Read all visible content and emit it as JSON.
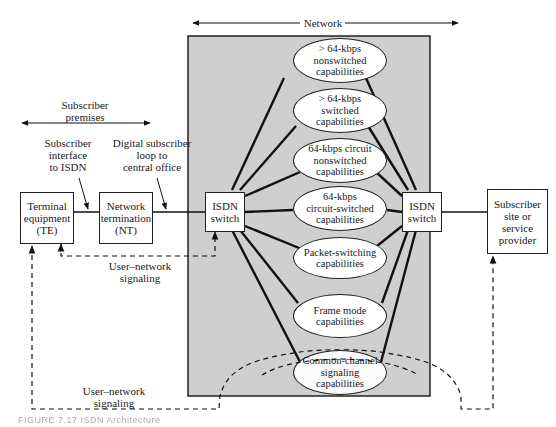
{
  "diagram": {
    "network_label": "Network",
    "subscriber_premises_label": "Subscriber\npremises",
    "annotations": {
      "subscriber_interface": "Subscriber\ninterface\nto ISDN",
      "digital_loop": "Digital subscriber\nloop to\ncentral office",
      "user_network_signaling_upper": "User–network\nsignaling",
      "user_network_signaling_lower": "User–network\nsignaling"
    },
    "nodes": {
      "te": "Terminal\nequipment\n(TE)",
      "nt": "Network\ntermination\n(NT)",
      "isdn_left": "ISDN\nswitch",
      "isdn_right": "ISDN\nswitch",
      "subscriber_site": "Subscriber\nsite or\nservice\nprovider"
    },
    "capabilities": [
      "> 64-kbps\nnonswitched\ncapabilities",
      "> 64-kbps\nswitched\ncapabilities",
      "64-kbps circuit\nnonswitched\ncapabilities",
      "64-kbps\ncircuit-switched\ncapabilities",
      "Packet-switching\ncapabilities",
      "Frame mode\ncapabilities",
      "Common-channel\nsignaling\ncapabilities"
    ],
    "caption": "FIGURE 7.17 ISDN Architecture",
    "colors": {
      "network_fill": "#cfcfcf",
      "line": "#111111",
      "background": "#ffffff"
    }
  }
}
